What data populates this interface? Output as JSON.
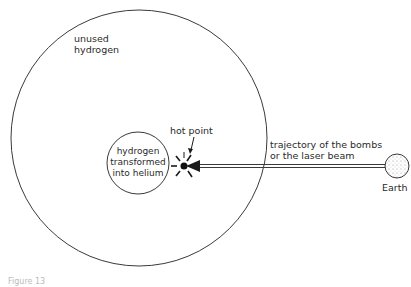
{
  "diagram": {
    "labels": {
      "outer": [
        "unused",
        "hydrogen"
      ],
      "inner": [
        "hydrogen",
        "transformed",
        "into helium"
      ],
      "hot_point": "hot point",
      "trajectory": [
        "trajectory of the bombs",
        "or the laser beam"
      ],
      "earth": "Earth",
      "caption": "Figure 13"
    },
    "colors": {
      "stroke": "#3a3a3a",
      "background": "#ffffff",
      "earth_fill": "#e8e8e8"
    }
  }
}
